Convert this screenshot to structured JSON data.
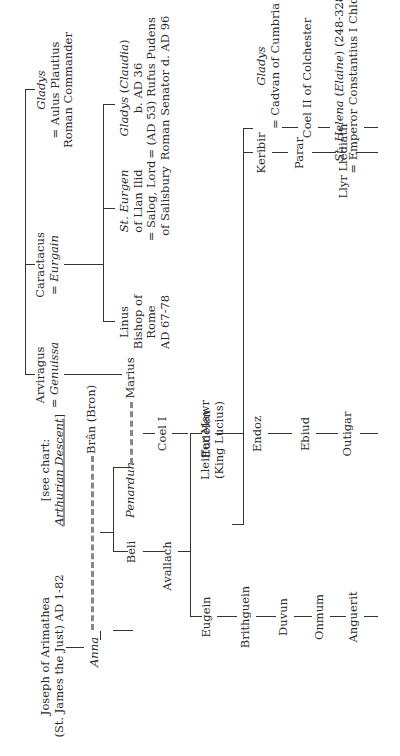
{
  "chart": {
    "type": "family-tree",
    "orientation": "rotated-90-ccw",
    "nodes": {
      "joseph": {
        "line1": "Joseph of Arimathea",
        "line2": "(St.  James the Just) AD 1-82"
      },
      "anna": {
        "name": "Anna"
      },
      "bran": {
        "name": "Brân (Bron)"
      },
      "see_chart": {
        "line1": "[see chart:",
        "line2": "Arthurian Descent",
        "line2_suffix": "]"
      },
      "penardun": {
        "name": "Penardun"
      },
      "marius": {
        "name": "Marius"
      },
      "beli": {
        "name": "Beli"
      },
      "avallach": {
        "name": "Avallach"
      },
      "eudelen": {
        "name": "Eudelen"
      },
      "endoz": {
        "name": "Endoz"
      },
      "ebiud": {
        "name": "Ebiud"
      },
      "outigar": {
        "name": "Outigar"
      },
      "eugein": {
        "name": "Eugein"
      },
      "brithguein": {
        "name": "Brithguein"
      },
      "duvun": {
        "name": "Duvun"
      },
      "onmum": {
        "name": "Onmum"
      },
      "anguerit": {
        "name": "Anguerit"
      },
      "arviragus": {
        "name": "Arviragus",
        "spouse": "= Genuissa",
        "spouse_name": "Genuissa",
        "eq": "= "
      },
      "caractacus": {
        "name": "Caractacus",
        "eq": "= ",
        "spouse_name": "Eurgain"
      },
      "gladys_top": {
        "name": "Gladys",
        "line2": "= Aulus Plautius",
        "line3": "Roman Commander"
      },
      "linus": {
        "line1": "Linus",
        "line2": "Bishop of",
        "line3": "Rome",
        "line4": "AD 67-78"
      },
      "st_eurgen": {
        "line1": "St. Eurgen",
        "line2": "of Llan Ilid",
        "line3": "= Salog, Lord",
        "line4": "of Salisbury"
      },
      "gladys_claudia": {
        "name": "Gladys",
        "paren_open": " (",
        "alt": "Claudia",
        "paren_close": ")",
        "line2": "b. AD 36",
        "line3": "= (AD 53) Rufus Pudens",
        "line4": "Roman Senator d. AD 96"
      },
      "coel1": {
        "name": "Coel I"
      },
      "lleiffer": {
        "line1": "Lleiffer Mawr",
        "line2": "(King Lucius)"
      },
      "keribir": {
        "name": "Keribir"
      },
      "parar": {
        "name": "Parar"
      },
      "llyr": {
        "name": "Llyr Llediath"
      },
      "gladys_cadvan": {
        "name": "Gladys",
        "line2": "= Cadvan of Cumbria"
      },
      "coel2": {
        "name": "Coel II of Colchester"
      },
      "helena": {
        "name": "St. Helena",
        "paren_open": " (",
        "alt": "Elaine",
        "paren_close": ")",
        "dates": " (248-328)",
        "line2": "= Emperor Constantius I Chlorus"
      }
    },
    "colors": {
      "line": "#333333",
      "dashed_marriage": "#888888",
      "text": "#2a2a2a",
      "background": "#ffffff"
    }
  }
}
